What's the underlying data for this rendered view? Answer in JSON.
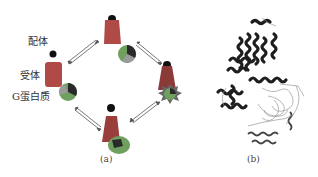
{
  "panel_a": {
    "labels": {
      "ligand": "配体",
      "receptor": "受体",
      "g_protein": "G蛋白质"
    },
    "caption": "(a)",
    "states": [
      "top",
      "right",
      "bottom",
      "left"
    ]
  },
  "panel_b": {
    "caption": "(b)",
    "description": "ribbon structure of receptor–G protein complex"
  },
  "colors": {
    "receptor": "#c0504d",
    "receptor_dark": "#8b2f2d",
    "ligand": "#111111",
    "g_alpha": "#2a2a2a",
    "g_beta": "#6a9e5a",
    "g_gamma": "#9a9a9a"
  }
}
